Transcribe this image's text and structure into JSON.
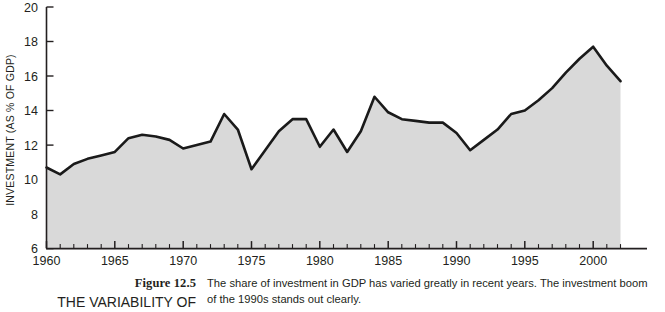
{
  "figure": {
    "number_label": "Figure 12.5",
    "title": "THE VARIABILITY OF",
    "caption_lines": [
      "The share of investment in GDP has varied greatly in recent years. The investment boom",
      "of the 1990s stands out clearly."
    ]
  },
  "colors": {
    "area_fill": "#d9d9d9",
    "line": "#1a1a1a",
    "axis": "#231f20",
    "text": "#231f20",
    "background": "#ffffff"
  },
  "chart_data": {
    "type": "area",
    "title": "",
    "xlabel": "",
    "ylabel": "INVESTMENT (AS % OF GDP)",
    "xlim": [
      1960,
      2002
    ],
    "ylim": [
      6,
      20
    ],
    "y_ticks": [
      6,
      8,
      10,
      12,
      14,
      16,
      18,
      20
    ],
    "x_ticks": [
      1960,
      1965,
      1970,
      1975,
      1980,
      1985,
      1990,
      1995,
      2000
    ],
    "x_minor_tick_interval": 1,
    "grid": false,
    "legend": false,
    "x": [
      1960,
      1961,
      1962,
      1963,
      1964,
      1965,
      1966,
      1967,
      1968,
      1969,
      1970,
      1971,
      1972,
      1973,
      1974,
      1975,
      1976,
      1977,
      1978,
      1979,
      1980,
      1981,
      1982,
      1983,
      1984,
      1985,
      1986,
      1987,
      1988,
      1989,
      1990,
      1991,
      1992,
      1993,
      1994,
      1995,
      1996,
      1997,
      1998,
      1999,
      2000,
      2001,
      2002
    ],
    "values": [
      10.7,
      10.3,
      10.9,
      11.2,
      11.4,
      11.6,
      12.4,
      12.6,
      12.5,
      12.3,
      11.8,
      12.0,
      12.2,
      13.8,
      12.9,
      10.6,
      11.7,
      12.8,
      13.5,
      13.5,
      11.9,
      12.9,
      11.6,
      12.8,
      14.8,
      13.9,
      13.5,
      13.4,
      13.3,
      13.3,
      12.7,
      11.7,
      12.3,
      12.9,
      13.8,
      14.0,
      14.6,
      15.3,
      16.2,
      17.0,
      17.7,
      16.6,
      15.7
    ],
    "series_name": "Investment as % of GDP",
    "annotations": []
  }
}
